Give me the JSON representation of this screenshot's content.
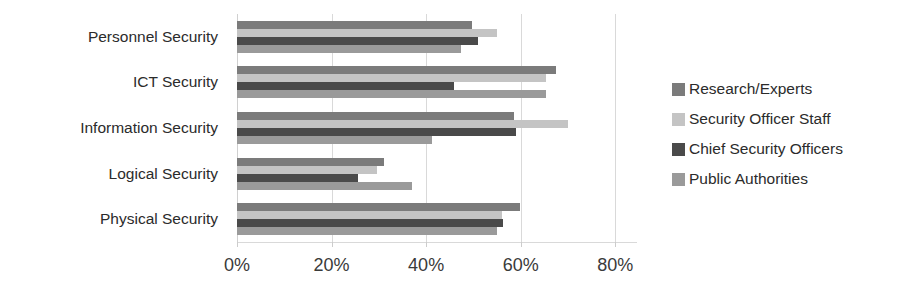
{
  "chart_data": {
    "type": "bar",
    "orientation": "horizontal",
    "title": "",
    "subtitle": "",
    "xlabel": "",
    "ylabel": "",
    "xlim": [
      0,
      84.6
    ],
    "x_tick_values": [
      0,
      20,
      40,
      60,
      80
    ],
    "x_tick_labels": [
      "0%",
      "20%",
      "40%",
      "60%",
      "80%"
    ],
    "grid": true,
    "grid_axis": "x",
    "legend_position": "right",
    "categories": [
      "Personnel Security",
      "ICT Security",
      "Information Security",
      "Logical Security",
      "Physical Security"
    ],
    "series": [
      {
        "name": "Research/Experts",
        "color": "#7b7b7b",
        "values": [
          49.7,
          67.5,
          58.5,
          31.0,
          59.8
        ]
      },
      {
        "name": "Security Officer Staff",
        "color": "#c4c4c4",
        "values": [
          55.0,
          65.4,
          70.0,
          29.6,
          56.0
        ]
      },
      {
        "name": "Chief Security Officers",
        "color": "#4a4a4a",
        "values": [
          50.9,
          45.9,
          59.0,
          25.5,
          56.3
        ]
      },
      {
        "name": "Public Authorities",
        "color": "#9a9a9a",
        "values": [
          47.3,
          65.4,
          41.2,
          37.1,
          55.0
        ]
      }
    ]
  },
  "legend": {
    "items": [
      {
        "label": "Research/Experts",
        "color": "#7b7b7b"
      },
      {
        "label": "Security Officer Staff",
        "color": "#c4c4c4"
      },
      {
        "label": "Chief Security Officers",
        "color": "#4a4a4a"
      },
      {
        "label": "Public Authorities",
        "color": "#9a9a9a"
      }
    ]
  },
  "colors": {
    "gridline": "#d9d9d9",
    "text": "#2b2b2b",
    "background": "#ffffff"
  }
}
